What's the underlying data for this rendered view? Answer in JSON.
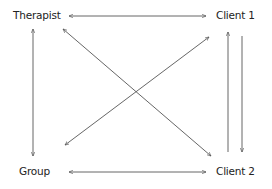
{
  "diagram": {
    "nodes": [
      {
        "id": "therapist",
        "label": "Therapist"
      },
      {
        "id": "client1",
        "label": "Client  1"
      },
      {
        "id": "group",
        "label": "Group"
      },
      {
        "id": "client2",
        "label": "Client  2"
      }
    ],
    "edges": [
      {
        "from": "therapist",
        "to": "client1",
        "direction": "both"
      },
      {
        "from": "group",
        "to": "client2",
        "direction": "both"
      },
      {
        "from": "therapist",
        "to": "group",
        "direction": "both"
      },
      {
        "from": "therapist",
        "to": "client2",
        "direction": "both"
      },
      {
        "from": "group",
        "to": "client1",
        "direction": "both"
      },
      {
        "from": "client2",
        "to": "client1",
        "direction": "one-way"
      },
      {
        "from": "client1",
        "to": "client2",
        "direction": "one-way"
      }
    ],
    "line_color": "#555555"
  }
}
